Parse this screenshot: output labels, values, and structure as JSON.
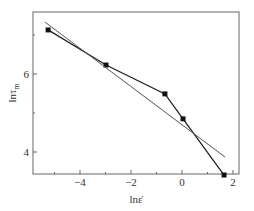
{
  "chart_data": {
    "type": "line",
    "title": "",
    "xlabel": "lnε̇",
    "ylabel": "lnτm",
    "xlim": [
      -5.9,
      2.2
    ],
    "ylim": [
      3.4,
      7.55
    ],
    "xticks": [
      -4,
      -2,
      0,
      2
    ],
    "yticks": [
      4,
      6
    ],
    "xtick_labels": [
      "-4",
      "-2",
      "0",
      "2"
    ],
    "ytick_labels": [
      "4",
      "6"
    ],
    "grid": false,
    "legend": null,
    "series": [
      {
        "name": "experimental",
        "style": "line-with-square-markers",
        "color": "#222222",
        "x": [
          -5.25,
          -2.98,
          -0.67,
          0.04,
          1.65
        ],
        "y": [
          7.13,
          6.23,
          5.49,
          4.85,
          3.41
        ]
      },
      {
        "name": "linear-fit",
        "style": "line",
        "color": "#555555",
        "x": [
          -5.37,
          1.69
        ],
        "y": [
          7.33,
          3.87
        ]
      }
    ]
  },
  "axes": {
    "xlabel_main": "lnε̇",
    "ylabel_main": "lnτ",
    "ylabel_sub": "m"
  }
}
